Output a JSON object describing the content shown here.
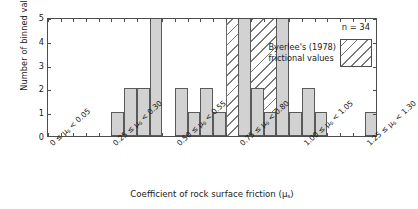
{
  "chart_data": {
    "type": "bar",
    "title": "",
    "subtitle": "",
    "xlabel": "Coefficient of rock surface friction (μₛ)",
    "ylabel": "Number of binned values",
    "xlim": [
      0,
      1.3
    ],
    "ylim": [
      0,
      5
    ],
    "bin_width": 0.05,
    "grid": false,
    "legend_position": "top-right",
    "annotation_n": "n = 34",
    "categories": [
      "0.00–0.05",
      "0.05–0.10",
      "0.10–0.15",
      "0.15–0.20",
      "0.20–0.25",
      "0.25–0.30",
      "0.30–0.35",
      "0.35–0.40",
      "0.40–0.45",
      "0.45–0.50",
      "0.50–0.55",
      "0.55–0.60",
      "0.60–0.65",
      "0.65–0.70",
      "0.70–0.75",
      "0.75–0.80",
      "0.80–0.85",
      "0.85–0.90",
      "0.90–0.95",
      "0.95–1.00",
      "1.00–1.05",
      "1.05–1.10",
      "1.10–1.15",
      "1.15–1.20",
      "1.20–1.25",
      "1.25–1.30"
    ],
    "bin_starts": [
      0.0,
      0.05,
      0.1,
      0.15,
      0.2,
      0.25,
      0.3,
      0.35,
      0.4,
      0.45,
      0.5,
      0.55,
      0.6,
      0.65,
      0.7,
      0.75,
      0.8,
      0.85,
      0.9,
      0.95,
      1.0,
      1.05,
      1.1,
      1.15,
      1.2,
      1.25
    ],
    "values": [
      0,
      0,
      0,
      0,
      0,
      1,
      2,
      2,
      5,
      0,
      2,
      1,
      2,
      1,
      0,
      5,
      2,
      1,
      5,
      1,
      2,
      1,
      0,
      0,
      0,
      1
    ],
    "y_ticks": [
      0,
      1,
      2,
      3,
      4,
      5
    ],
    "x_tick_labels": [
      {
        "at": 0.0,
        "text_a": "0 ≤ μ",
        "sub": "s",
        "text_b": " < 0.05"
      },
      {
        "at": 0.25,
        "text_a": "0.25 ≤ μ",
        "sub": "s",
        "text_b": " < 0.30"
      },
      {
        "at": 0.5,
        "text_a": "0.50 ≤ μ",
        "sub": "s",
        "text_b": " < 0.55"
      },
      {
        "at": 0.75,
        "text_a": "0.75 ≤ μ",
        "sub": "s",
        "text_b": " < 0.80"
      },
      {
        "at": 1.0,
        "text_a": "1.00 ≤ μ",
        "sub": "s",
        "text_b": " < 1.05"
      },
      {
        "at": 1.25,
        "text_a": "1.25 ≤ μ",
        "sub": "s",
        "text_b": " < 1.30"
      }
    ],
    "shaded_region": {
      "label_line1": "Byerlee's (1978)",
      "label_line2": "frictional values",
      "x_start": 0.7,
      "x_end": 0.95,
      "fill": "hatch-diagonal"
    },
    "colors": {
      "bar_fill": "#d2d2d2",
      "bar_edge": "#5a5a5a",
      "axis": "#4d4d4d",
      "hatch": "#7a7a7a",
      "background": "#ffffff",
      "text": "#1a1a1a"
    }
  },
  "xlabel_parts": {
    "lead": "Coefficient of rock surface friction (μ",
    "sub": "s",
    "tail": ")"
  }
}
